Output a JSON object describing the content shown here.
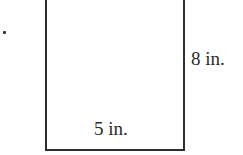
{
  "diagram": {
    "shape": "rectangle",
    "labels": {
      "height": "8 in.",
      "width": "5 in."
    },
    "colors": {
      "stroke": "#2e2e2e",
      "text": "#2a2a2a",
      "background": "#ffffff"
    }
  }
}
